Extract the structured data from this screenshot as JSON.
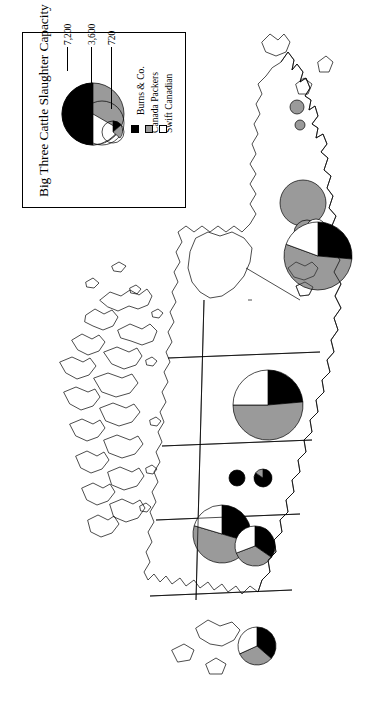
{
  "figure": {
    "kind": "proportional-symbol-map",
    "subject": "Big Three Cattle Slaughter Capacity",
    "region": "Canada",
    "orientation": "map rotated 90 degrees counter-clockwise"
  },
  "legend": {
    "title": "Big Three Cattle Slaughter Capacity",
    "scale_labels": [
      "7,200",
      "3,600",
      "720"
    ],
    "entries": [
      {
        "label": "Burns & Co.",
        "color": "#000000",
        "swatch": "black-swatch"
      },
      {
        "label": "Canada Packers",
        "color": "#9a9a9a",
        "swatch": "gray-swatch"
      },
      {
        "label": "Swift Canadian",
        "color": "#ffffff",
        "swatch": "white-swatch"
      }
    ]
  },
  "colors": {
    "burns": "#000000",
    "canada_packers": "#9a9a9a",
    "swift_canadian": "#ffffff",
    "outline": "#000000",
    "background": "#ffffff"
  },
  "chart_data": {
    "type": "pie",
    "title": "Big Three Cattle Slaughter Capacity",
    "units": "head per day (capacity)",
    "categories": [
      "Burns & Co.",
      "Canada Packers",
      "Swift Canadian"
    ],
    "colors": [
      "#000000",
      "#9a9a9a",
      "#ffffff"
    ],
    "size_scale": {
      "reference_values": [
        7200,
        3600,
        720
      ],
      "reference_radii_px": [
        34,
        24,
        11
      ],
      "note": "circle area proportional to total slaughter capacity"
    },
    "legend_position": "top-left inset box",
    "grid": false,
    "pies": [
      {
        "id": "pie-east-large",
        "place": "southern-ontario",
        "cx": 318,
        "cy": 256,
        "r": 34,
        "total": 7200,
        "values": [
          1900,
          3900,
          1400
        ],
        "shares": [
          0.264,
          0.542,
          0.194
        ]
      },
      {
        "id": "pie-east-upper",
        "place": "quebec-montreal",
        "cx": 303,
        "cy": 203,
        "r": 23,
        "total": 3300,
        "values": [
          0,
          3300,
          0
        ],
        "shares": [
          0.0,
          1.0,
          0.0
        ]
      },
      {
        "id": "pie-east-mid",
        "place": "ottawa-valley",
        "cx": 307,
        "cy": 233,
        "r": 13,
        "total": 1000,
        "values": [
          0,
          1000,
          0
        ],
        "shares": [
          0.0,
          1.0,
          0.0
        ]
      },
      {
        "id": "pie-east-small-outline",
        "place": "eastern-ontario",
        "cx": 316,
        "cy": 229,
        "r": 10,
        "total": 600,
        "values": [
          0,
          0,
          600
        ],
        "shares": [
          0.0,
          0.0,
          1.0
        ]
      },
      {
        "id": "pie-far-north-a",
        "place": "northern-quebec-node-a",
        "cx": 297,
        "cy": 107,
        "r": 7,
        "total": 350,
        "values": [
          0,
          350,
          0
        ],
        "shares": [
          0.0,
          1.0,
          0.0
        ]
      },
      {
        "id": "pie-far-north-b",
        "place": "northern-quebec-node-b",
        "cx": 300,
        "cy": 125,
        "r": 5,
        "total": 200,
        "values": [
          0,
          200,
          0
        ],
        "shares": [
          0.0,
          1.0,
          0.0
        ]
      },
      {
        "id": "pie-prairie-north",
        "place": "edmonton",
        "cx": 268,
        "cy": 405,
        "r": 35,
        "total": 7200,
        "values": [
          1700,
          3700,
          1800
        ],
        "shares": [
          0.236,
          0.514,
          0.25
        ]
      },
      {
        "id": "dot-saskatoon",
        "place": "saskatoon",
        "cx": 237,
        "cy": 478,
        "r": 8,
        "total": 430,
        "values": [
          430,
          0,
          0
        ],
        "shares": [
          1.0,
          0.0,
          0.0
        ]
      },
      {
        "id": "dot-regina",
        "place": "regina",
        "cx": 263,
        "cy": 478,
        "r": 9,
        "total": 520,
        "values": [
          440,
          80,
          0
        ],
        "shares": [
          0.846,
          0.154,
          0.0
        ]
      },
      {
        "id": "pie-calgary",
        "place": "calgary",
        "cx": 222,
        "cy": 534,
        "r": 29,
        "total": 5400,
        "values": [
          1600,
          2700,
          1100
        ],
        "shares": [
          0.296,
          0.5,
          0.204
        ]
      },
      {
        "id": "pie-winnipeg",
        "place": "winnipeg",
        "cx": 255,
        "cy": 546,
        "r": 20,
        "total": 2600,
        "values": [
          900,
          900,
          800
        ],
        "shares": [
          0.346,
          0.346,
          0.308
        ]
      },
      {
        "id": "pie-vancouver",
        "place": "vancouver",
        "cx": 257,
        "cy": 646,
        "r": 19,
        "total": 2200,
        "values": [
          800,
          700,
          700
        ],
        "shares": [
          0.364,
          0.318,
          0.318
        ]
      }
    ]
  }
}
